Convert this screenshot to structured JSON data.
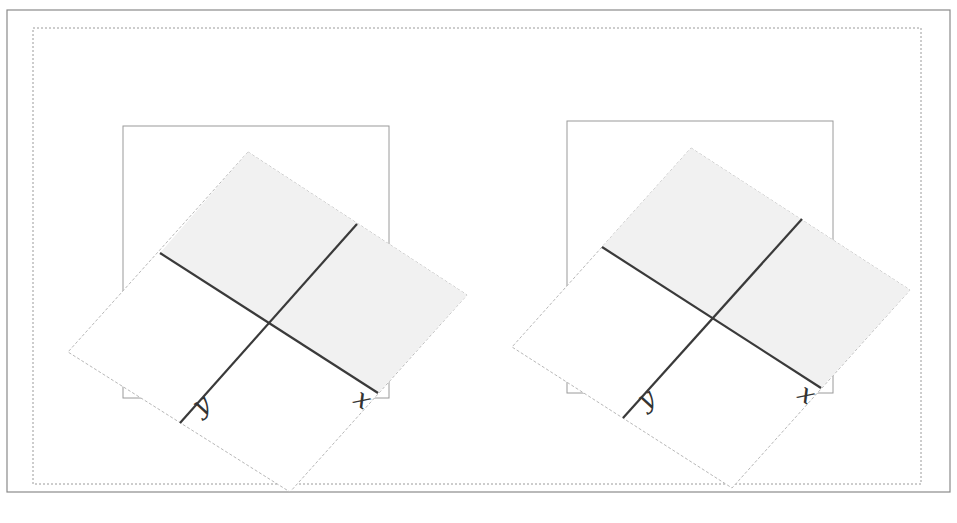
{
  "figure": {
    "outer_frame": {
      "x": 7,
      "y": 10,
      "w": 943,
      "h": 482,
      "stroke": "#8a8a8a"
    },
    "inner_frame": {
      "x": 33,
      "y": 28,
      "w": 888,
      "h": 456,
      "stroke": "#9a9a9a"
    },
    "colors": {
      "box_stroke": "#9a9a9a",
      "rhombus_stroke": "#b8b8b8",
      "shade_fill": "#f1f1f1",
      "axis_line": "#3a3a3a",
      "label": "#333333"
    },
    "panels": [
      {
        "id": "left",
        "box": {
          "x": 123,
          "y": 126,
          "w": 266,
          "h": 272
        },
        "rhombus": [
          [
            248,
            152
          ],
          [
            467,
            295
          ],
          [
            290,
            492
          ],
          [
            68,
            352
          ]
        ],
        "shaded_region": [
          [
            248,
            152
          ],
          [
            467,
            295
          ],
          [
            378,
            393
          ],
          [
            268,
            322
          ],
          [
            160,
            253
          ]
        ],
        "axis_x": {
          "from": [
            160,
            253
          ],
          "to": [
            378,
            393
          ],
          "label": "x",
          "label_pos": [
            352,
            402
          ],
          "label_rot": 35
        },
        "axis_y": {
          "from": [
            180,
            423
          ],
          "to": [
            357,
            224
          ],
          "label": "y",
          "label_pos": [
            200,
            416
          ],
          "label_rot": -35
        }
      },
      {
        "id": "right",
        "box": {
          "x": 567,
          "y": 121,
          "w": 266,
          "h": 272
        },
        "rhombus": [
          [
            691,
            148
          ],
          [
            910,
            290
          ],
          [
            732,
            488
          ],
          [
            512,
            347
          ]
        ],
        "shaded_region": [
          [
            691,
            148
          ],
          [
            910,
            290
          ],
          [
            821,
            388
          ],
          [
            712,
            318
          ],
          [
            602,
            247
          ]
        ],
        "axis_x": {
          "from": [
            602,
            247
          ],
          "to": [
            821,
            388
          ],
          "label": "x",
          "label_pos": [
            796,
            397
          ],
          "label_rot": 35
        },
        "axis_y": {
          "from": [
            623,
            418
          ],
          "to": [
            802,
            219
          ],
          "label": "y",
          "label_pos": [
            645,
            410
          ],
          "label_rot": -35
        }
      }
    ]
  }
}
